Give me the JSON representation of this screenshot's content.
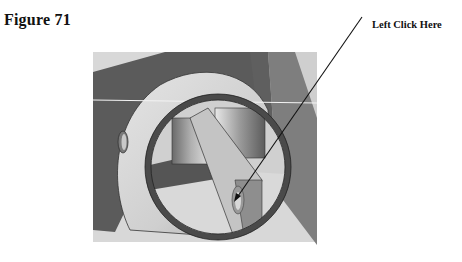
{
  "figure": {
    "title": "Figure 71",
    "callout_label": "Left Click Here",
    "colors": {
      "background": "#ffffff",
      "dark_face": "#5a5a5a",
      "mid_face": "#8a8a8a",
      "light_face": "#d6d6d6",
      "ring": "#4a4a4a",
      "arrow": "#111111"
    }
  }
}
